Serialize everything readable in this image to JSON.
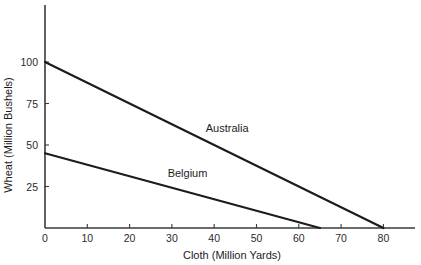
{
  "chart_data": {
    "type": "line",
    "title": "",
    "xlabel": "Cloth (Million Yards)",
    "ylabel": "Wheat (Million Bushels)",
    "xlim": [
      0,
      88
    ],
    "ylim": [
      0,
      125
    ],
    "xticks": [
      0,
      10,
      20,
      30,
      40,
      50,
      60,
      70,
      80
    ],
    "yticks": [
      25,
      50,
      75,
      100
    ],
    "xticklabels": [
      "0",
      "10",
      "20",
      "30",
      "40",
      "50",
      "60",
      "70",
      "80"
    ],
    "yticklabels": [
      "25",
      "50",
      "75",
      "100"
    ],
    "grid": false,
    "legend_position": "inline-annotation",
    "series": [
      {
        "name": "Australia",
        "label": "Australia",
        "color": "#1c1c1c",
        "x": [
          0,
          80
        ],
        "values": [
          100,
          0
        ],
        "label_x": 38,
        "label_y": 58
      },
      {
        "name": "Belgium",
        "label": "Belgium",
        "color": "#1c1c1c",
        "x": [
          0,
          65
        ],
        "values": [
          45,
          0
        ],
        "label_x": 29,
        "label_y": 31
      }
    ],
    "annotations": []
  },
  "colors": {
    "axis": "#3a3a3a",
    "line": "#1c1c1c",
    "text": "#1c1c1c",
    "background": "#ffffff"
  }
}
